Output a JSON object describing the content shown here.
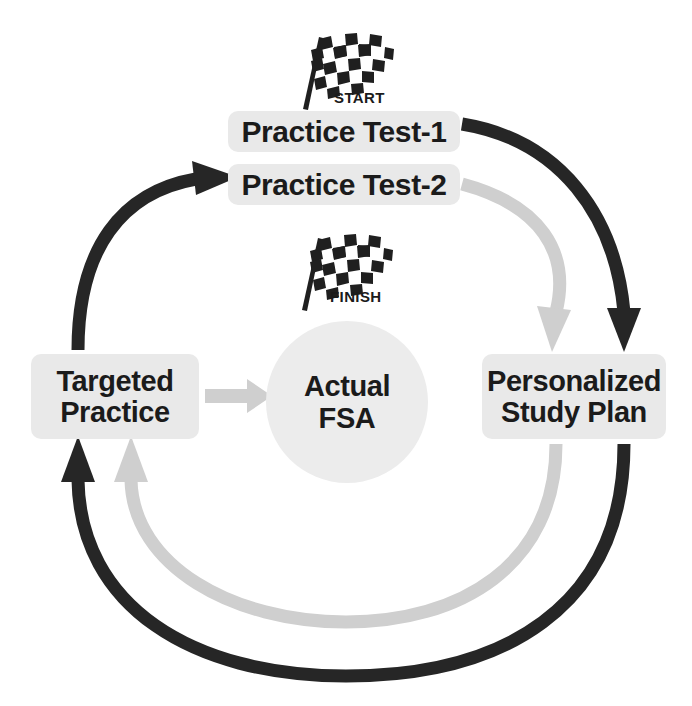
{
  "diagram": {
    "type": "cycle-flow-diagram",
    "colors": {
      "dark_arrow": "#262626",
      "light_arrow": "#cfcfcf",
      "chip_fill": "#e9e9e9",
      "circle_fill": "#ececec",
      "text": "#1b1b1b",
      "background": "#ffffff"
    }
  },
  "nodes": {
    "practice_test_1": {
      "label": "Practice Test-1"
    },
    "practice_test_2": {
      "label": "Practice Test-2"
    },
    "targeted_practice": {
      "line1": "Targeted",
      "line2": "Practice"
    },
    "personalized_study_plan": {
      "line1": "Personalized",
      "line2": "Study Plan"
    },
    "actual_fsa": {
      "line1": "Actual",
      "line2": "FSA"
    }
  },
  "markers": {
    "start_flag": {
      "caption": "START",
      "icon": "checkered-flag-icon"
    },
    "finish_flag": {
      "caption": "FINISH",
      "icon": "checkered-flag-icon"
    }
  },
  "connections": [
    {
      "id": "pt1-to-psp",
      "from": "practice_test_1",
      "to": "personalized_study_plan",
      "style": "dark",
      "shape": "arc"
    },
    {
      "id": "pt2-to-psp",
      "from": "practice_test_2",
      "to": "personalized_study_plan",
      "style": "light",
      "shape": "arc"
    },
    {
      "id": "psp-to-tp-outer",
      "from": "personalized_study_plan",
      "to": "targeted_practice",
      "style": "dark",
      "shape": "arc"
    },
    {
      "id": "psp-to-tp-inner",
      "from": "personalized_study_plan",
      "to": "targeted_practice",
      "style": "light",
      "shape": "arc"
    },
    {
      "id": "tp-to-pt2",
      "from": "targeted_practice",
      "to": "practice_test_2",
      "style": "dark",
      "shape": "arc"
    },
    {
      "id": "tp-to-fsa",
      "from": "targeted_practice",
      "to": "actual_fsa",
      "style": "light",
      "shape": "straight"
    }
  ]
}
